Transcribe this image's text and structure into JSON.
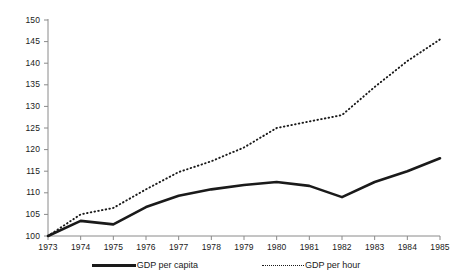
{
  "chart_data": {
    "type": "line",
    "title": "",
    "subtitle": "",
    "xlabel": "",
    "ylabel": "",
    "x": [
      1973,
      1974,
      1975,
      1976,
      1977,
      1978,
      1979,
      1980,
      1981,
      1982,
      1983,
      1984,
      1985
    ],
    "categories": [
      "1973",
      "1974",
      "1975",
      "1976",
      "1977",
      "1978",
      "1979",
      "1980",
      "1981",
      "1982",
      "1983",
      "1984",
      "1985"
    ],
    "xlim": [
      1973,
      1985
    ],
    "ylim": [
      100,
      150
    ],
    "yticks": [
      100,
      105,
      110,
      115,
      120,
      125,
      130,
      135,
      140,
      145,
      150
    ],
    "xticks": [
      "1973",
      "1974",
      "1975",
      "1976",
      "1977",
      "1978",
      "1979",
      "1980",
      "1981",
      "1982",
      "1983",
      "1984",
      "1985"
    ],
    "grid": false,
    "legend_position": "bottom",
    "line_color": "#1a1a1a",
    "series": [
      {
        "name": "GDP per capita",
        "style": "solid",
        "values": [
          100,
          103.5,
          102.7,
          106.7,
          109.3,
          110.8,
          111.8,
          112.5,
          111.6,
          109.0,
          112.5,
          115.0,
          118.0
        ]
      },
      {
        "name": "GDP per hour",
        "style": "dotted",
        "values": [
          100,
          105.0,
          106.5,
          110.8,
          114.8,
          117.3,
          120.5,
          125.0,
          126.5,
          128.0,
          134.5,
          140.5,
          145.5
        ]
      }
    ]
  },
  "legend": {
    "entries": [
      {
        "label": "GDP per capita",
        "style": "solid"
      },
      {
        "label": "GDP per hour",
        "style": "dotted"
      }
    ]
  },
  "axes": {
    "y_axis_color": "#8a8a8a",
    "x_axis_color": "#8a8a8a"
  }
}
